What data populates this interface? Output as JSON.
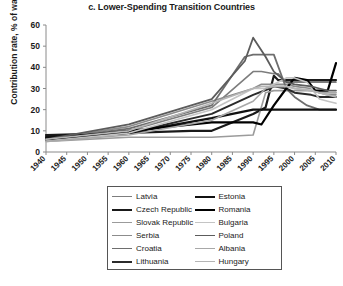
{
  "chart_data": {
    "type": "line",
    "title": "c. Lower-Spending Transition Countries",
    "xlabel": "",
    "ylabel": "Contribution rate, % of wage",
    "xlim": [
      1940,
      2010
    ],
    "ylim": [
      0,
      60
    ],
    "yticks": [
      0,
      10,
      20,
      30,
      40,
      50,
      60
    ],
    "xticks": [
      1940,
      1945,
      1950,
      1955,
      1960,
      1965,
      1970,
      1975,
      1980,
      1985,
      1990,
      1995,
      2000,
      2005,
      2010
    ],
    "grid": false,
    "legend_position": "below-plot",
    "series": [
      {
        "name": "Latvia",
        "color": "#7d7d7d",
        "x": [
          1940,
          1960,
          1980,
          1990,
          1992,
          1995,
          1996,
          1998,
          2000,
          2002,
          2005,
          2008,
          2010
        ],
        "values": [
          6,
          10,
          21,
          38,
          38,
          37,
          37,
          33,
          33,
          33,
          33,
          33,
          33
        ]
      },
      {
        "name": "Czech Republic",
        "color": "#1a1a1a",
        "x": [
          1940,
          1960,
          1975,
          1980,
          1990,
          1993,
          1995,
          1996,
          2000,
          2004,
          2006,
          2008,
          2010
        ],
        "values": [
          8,
          9,
          10,
          10,
          18,
          21,
          36,
          34,
          34,
          34,
          34,
          34,
          34
        ]
      },
      {
        "name": "Slovak Republic",
        "color": "#9b9b9b",
        "x": [
          1940,
          1960,
          1980,
          1990,
          1993,
          1995,
          1998,
          2000,
          2004,
          2006,
          2008,
          2010
        ],
        "values": [
          5,
          7,
          7,
          8,
          28,
          29,
          29,
          29,
          29,
          28,
          28,
          28
        ]
      },
      {
        "name": "Serbia",
        "color": "#8c8c8c",
        "x": [
          1940,
          1960,
          1980,
          1990,
          1992,
          1995,
          1998,
          2000,
          2004,
          2006,
          2008,
          2010
        ],
        "values": [
          6,
          12,
          24,
          30,
          32,
          32,
          32,
          31,
          30,
          28,
          27,
          27
        ]
      },
      {
        "name": "Croatia",
        "color": "#6e6e6e",
        "x": [
          1940,
          1960,
          1980,
          1988,
          1990,
          1993,
          1995,
          1998,
          2000,
          2003,
          2006,
          2008,
          2010
        ],
        "values": [
          6,
          11,
          22,
          45,
          46,
          46,
          46,
          30,
          26,
          22,
          20,
          20,
          20
        ]
      },
      {
        "name": "Lithuania",
        "color": "#2b2b2b",
        "x": [
          1940,
          1960,
          1980,
          1990,
          1994,
          1995,
          1998,
          2000,
          2004,
          2006,
          2008,
          2010
        ],
        "values": [
          6,
          9,
          18,
          27,
          30,
          31,
          30,
          28,
          27,
          26,
          26,
          26
        ]
      },
      {
        "name": "Estonia",
        "color": "#111111",
        "x": [
          1940,
          1960,
          1980,
          1990,
          1992,
          1994,
          1996,
          2000,
          2004,
          2006,
          2008,
          2010
        ],
        "values": [
          7,
          9,
          16,
          20,
          20,
          20,
          20,
          20,
          20,
          20,
          20,
          20
        ]
      },
      {
        "name": "Romania",
        "color": "#000000",
        "x": [
          1940,
          1960,
          1980,
          1990,
          1992,
          1995,
          1998,
          2000,
          2003,
          2005,
          2008,
          2010
        ],
        "values": [
          6,
          10,
          14,
          14,
          13,
          22,
          30,
          35,
          34,
          29,
          29,
          42
        ]
      },
      {
        "name": "Bulgaria",
        "color": "#c4c4c4",
        "x": [
          1940,
          1960,
          1980,
          1990,
          1993,
          1995,
          1998,
          2000,
          2003,
          2006,
          2008,
          2010
        ],
        "values": [
          5,
          9,
          20,
          30,
          30,
          32,
          35,
          35,
          33,
          25,
          24,
          23
        ]
      },
      {
        "name": "Poland",
        "color": "#5c5c5c",
        "x": [
          1940,
          1960,
          1980,
          1988,
          1990,
          1993,
          1995,
          1998,
          2000,
          2004,
          2006,
          2008,
          2010
        ],
        "values": [
          6,
          13,
          25,
          43,
          54,
          45,
          38,
          33,
          32,
          31,
          30,
          29,
          29
        ]
      },
      {
        "name": "Albania",
        "color": "#a8a8a8",
        "x": [
          1940,
          1960,
          1980,
          1990,
          1993,
          1995,
          1998,
          2000,
          2004,
          2006,
          2008,
          2010
        ],
        "values": [
          5,
          8,
          15,
          24,
          30,
          31,
          31,
          30,
          29,
          28,
          28,
          28
        ]
      },
      {
        "name": "Hungary",
        "color": "#b5b5b5",
        "x": [
          1940,
          1960,
          1980,
          1990,
          1992,
          1995,
          1998,
          2000,
          2004,
          2006,
          2008,
          2010
        ],
        "values": [
          6,
          10,
          23,
          30,
          31,
          31,
          31,
          30,
          29,
          28,
          27,
          26
        ]
      }
    ]
  },
  "legend": {
    "entries": [
      {
        "label": "Latvia",
        "color": "#7d7d7d",
        "width": 1.6
      },
      {
        "label": "Estonia",
        "color": "#111111",
        "width": 2.2
      },
      {
        "label": "Czech Republic",
        "color": "#1a1a1a",
        "width": 2.2
      },
      {
        "label": "Romania",
        "color": "#000000",
        "width": 2.2
      },
      {
        "label": "Slovak Republic",
        "color": "#9b9b9b",
        "width": 1.6
      },
      {
        "label": "Bulgaria",
        "color": "#c4c4c4",
        "width": 1.6
      },
      {
        "label": "Serbia",
        "color": "#8c8c8c",
        "width": 1.6
      },
      {
        "label": "Poland",
        "color": "#5c5c5c",
        "width": 1.8
      },
      {
        "label": "Croatia",
        "color": "#6e6e6e",
        "width": 1.8
      },
      {
        "label": "Albania",
        "color": "#a8a8a8",
        "width": 1.6
      },
      {
        "label": "Lithuania",
        "color": "#2b2b2b",
        "width": 2.0
      },
      {
        "label": "Hungary",
        "color": "#b5b5b5",
        "width": 1.6
      }
    ]
  },
  "axes": {
    "axis_color": "#8a8a8a"
  }
}
